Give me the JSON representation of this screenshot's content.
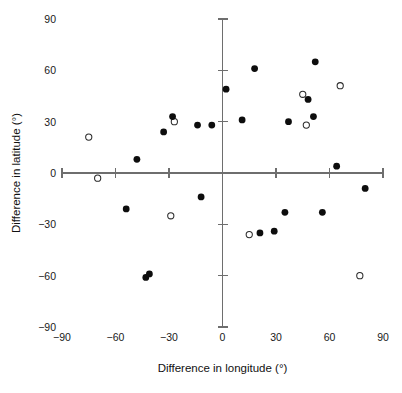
{
  "chart_data": {
    "type": "scatter",
    "title": "",
    "xlabel": "Difference in longitude (°)",
    "ylabel": "Difference in latitude (°)",
    "xlim": [
      -90,
      90
    ],
    "ylim": [
      -90,
      90
    ],
    "xticks": [
      -90,
      -60,
      -30,
      0,
      30,
      60,
      90
    ],
    "yticks": [
      -90,
      -60,
      -30,
      0,
      30,
      60,
      90
    ],
    "xticklabels": [
      "−90",
      "−60",
      "−30",
      "0",
      "30",
      "60",
      "90"
    ],
    "yticklabels": [
      "−90",
      "−60",
      "−30",
      "0",
      "30",
      "60",
      "90"
    ],
    "grid": false,
    "legend": null,
    "axes_style": "crossed-spines-at-origin",
    "series": [
      {
        "name": "filled",
        "marker": "filled-circle",
        "color": "#0d0d0d",
        "points": [
          [
            -48,
            8
          ],
          [
            -54,
            -21
          ],
          [
            -43,
            -61
          ],
          [
            -41,
            -59
          ],
          [
            -33,
            24
          ],
          [
            -28,
            33
          ],
          [
            -14,
            28
          ],
          [
            -12,
            -14
          ],
          [
            -6,
            28
          ],
          [
            2,
            49
          ],
          [
            11,
            31
          ],
          [
            18,
            61
          ],
          [
            21,
            -35
          ],
          [
            29,
            -34
          ],
          [
            35,
            -23
          ],
          [
            37,
            30
          ],
          [
            48,
            43
          ],
          [
            51,
            33
          ],
          [
            52,
            65
          ],
          [
            56,
            -23
          ],
          [
            64,
            4
          ],
          [
            80,
            -9
          ]
        ]
      },
      {
        "name": "open",
        "marker": "open-circle",
        "color": "#ffffff",
        "edgecolor": "#2a2a2a",
        "points": [
          [
            -75,
            21
          ],
          [
            -70,
            -3
          ],
          [
            -29,
            -25
          ],
          [
            -27,
            30
          ],
          [
            15,
            -36
          ],
          [
            45,
            46
          ],
          [
            47,
            28
          ],
          [
            66,
            51
          ],
          [
            77,
            -60
          ]
        ]
      }
    ]
  },
  "axes": {
    "x_title": "Difference in longitude (°)",
    "y_title": "Difference in latitude (°)"
  }
}
